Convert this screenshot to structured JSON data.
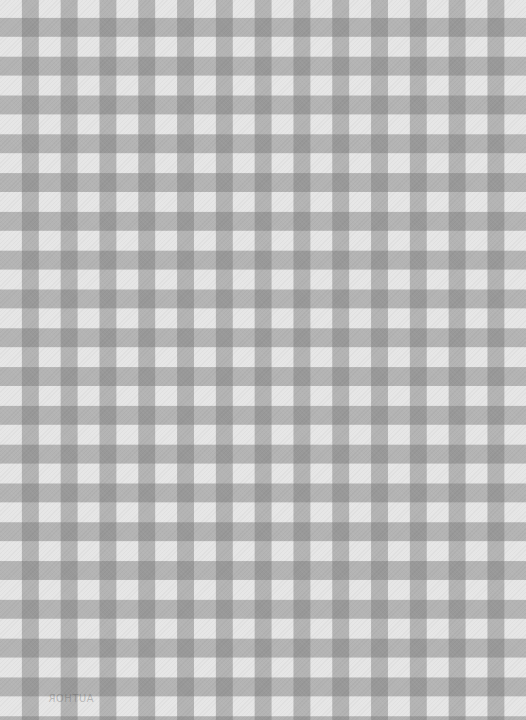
{
  "image": {
    "description": "Grey and white gingham checkered fabric pattern",
    "colors": {
      "light": "#e6e6e6",
      "mid": "#b4b4b4",
      "dark": "#959595"
    },
    "pattern": {
      "period_px": 38.8,
      "stripe_width_px": 19
    }
  },
  "caption": {
    "text": "AUTHOR",
    "note": "faint mirrored bleed-through text near bottom"
  }
}
